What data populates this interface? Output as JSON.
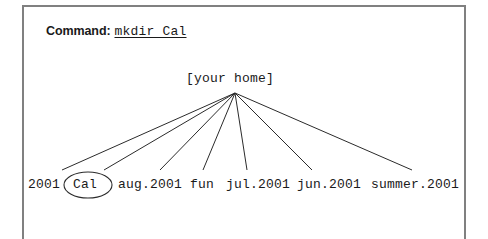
{
  "figure": {
    "background_color": "#ffffff",
    "frame_color": "#808080",
    "ink_color": "#1a1a1a",
    "line_color": "#2b2b2b"
  },
  "command": {
    "label": "Command:",
    "value": "mkdir Cal"
  },
  "tree": {
    "root": {
      "label": "[your home]",
      "apex_x": 235,
      "apex_y": 93
    },
    "leaves": [
      {
        "label": "2001",
        "x": 28,
        "end_x": 62,
        "highlighted": false
      },
      {
        "label": "Cal",
        "x": 73,
        "end_x": 104,
        "highlighted": true
      },
      {
        "label": "aug.2001",
        "x": 118,
        "end_x": 160,
        "highlighted": false
      },
      {
        "label": "fun",
        "x": 190,
        "end_x": 203,
        "highlighted": false
      },
      {
        "label": "jul.2001",
        "x": 226,
        "end_x": 247,
        "highlighted": false
      },
      {
        "label": "jun.2001",
        "x": 297,
        "end_x": 312,
        "highlighted": false
      },
      {
        "label": "summer.2001",
        "x": 371,
        "end_x": 412,
        "highlighted": false
      }
    ],
    "highlight": {
      "shape": "ellipse",
      "target_label": "Cal",
      "cx": 88,
      "cy": 185,
      "rx": 24,
      "ry": 13
    }
  }
}
